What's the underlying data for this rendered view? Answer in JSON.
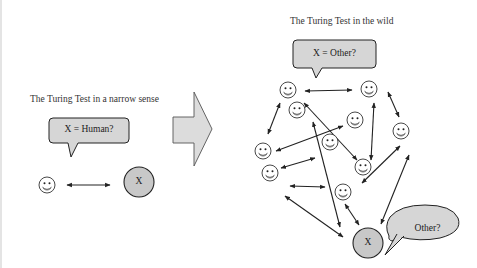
{
  "left_panel": {
    "title": "The Turing Test in a narrow sense",
    "bubble_text": "X = Human?",
    "node_label": "X"
  },
  "right_panel": {
    "title": "The Turing Test in the wild",
    "bubble_text": "X = Other?",
    "node_label": "X",
    "reply_bubble_text": "Other?"
  },
  "colors": {
    "bubble_fill": "#d6d6d6",
    "node_fill": "#c8c8c8",
    "stroke": "#222222",
    "arrow_fill": "#dcdcdc"
  }
}
